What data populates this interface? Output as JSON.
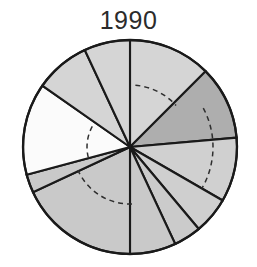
{
  "chart_data": {
    "type": "pie",
    "title": "1990",
    "subtitle": "",
    "xlabel": "",
    "ylabel": "",
    "legend": [],
    "grid": false,
    "start_angle_deg": 0,
    "direction": "clockwise",
    "center": {
      "x": 130,
      "y": 147
    },
    "radius": 107,
    "categories": [
      "slice-1",
      "slice-2",
      "slice-3",
      "slice-4",
      "slice-5",
      "slice-6",
      "slice-7",
      "slice-8",
      "slice-9",
      "slice-10",
      "slice-11"
    ],
    "values": [
      12.5,
      11.1,
      9.7,
      5.6,
      4.2,
      6.9,
      18.1,
      2.8,
      13.9,
      8.3,
      6.9
    ],
    "slices": [
      {
        "name": "slice-1",
        "start_deg": 0,
        "end_deg": 45,
        "sweep_deg": 45,
        "value": 12.5,
        "fill": "#d5d5d5",
        "dash_radius": 62
      },
      {
        "name": "slice-2",
        "start_deg": 45,
        "end_deg": 85,
        "sweep_deg": 40,
        "value": 11.1,
        "fill": "#aeaeae",
        "dash_radius": 0
      },
      {
        "name": "slice-3",
        "start_deg": 85,
        "end_deg": 120,
        "sweep_deg": 35,
        "value": 9.7,
        "fill": "#d0d0d0",
        "dash_radius": 82
      },
      {
        "name": "slice-4",
        "start_deg": 120,
        "end_deg": 140,
        "sweep_deg": 20,
        "value": 5.6,
        "fill": "#cfcfcf",
        "dash_radius": 82
      },
      {
        "name": "slice-5",
        "start_deg": 140,
        "end_deg": 155,
        "sweep_deg": 15,
        "value": 4.2,
        "fill": "#cbcbcb",
        "dash_radius": 0
      },
      {
        "name": "slice-6",
        "start_deg": 155,
        "end_deg": 180,
        "sweep_deg": 25,
        "value": 6.9,
        "fill": "#c9c9c9",
        "dash_radius": 0
      },
      {
        "name": "slice-7",
        "start_deg": 180,
        "end_deg": 245,
        "sweep_deg": 65,
        "value": 18.1,
        "fill": "#c9c9c9",
        "dash_radius": 57
      },
      {
        "name": "slice-8",
        "start_deg": 245,
        "end_deg": 255,
        "sweep_deg": 10,
        "value": 2.8,
        "fill": "#c9c9c9",
        "dash_radius": 0
      },
      {
        "name": "slice-9",
        "start_deg": 255,
        "end_deg": 305,
        "sweep_deg": 50,
        "value": 13.9,
        "fill": "#fbfbfb",
        "dash_radius": 43
      },
      {
        "name": "slice-10",
        "start_deg": 305,
        "end_deg": 335,
        "sweep_deg": 30,
        "value": 8.3,
        "fill": "#d5d5d5",
        "dash_radius": 0
      },
      {
        "name": "slice-11",
        "start_deg": 335,
        "end_deg": 360,
        "sweep_deg": 25,
        "value": 6.9,
        "fill": "#d5d5d5",
        "dash_radius": 0
      }
    ],
    "dashed_reference_arcs": [
      {
        "name": "arc-upper-right",
        "start_deg": 5,
        "end_deg": 48,
        "radius": 62
      },
      {
        "name": "arc-right",
        "start_deg": 62,
        "end_deg": 120,
        "radius": 83
      },
      {
        "name": "arc-lower",
        "start_deg": 178,
        "end_deg": 246,
        "radius": 57
      },
      {
        "name": "arc-left",
        "start_deg": 256,
        "end_deg": 300,
        "radius": 43
      }
    ]
  },
  "colors": {
    "outline": "#1a1a1a",
    "title_text": "#2b2b2b",
    "background": "#ffffff",
    "fill_light": "#d5d5d5",
    "fill_medium": "#aeaeae",
    "fill_white": "#fbfbfb",
    "fill_mid_light": "#c9c9c9"
  }
}
